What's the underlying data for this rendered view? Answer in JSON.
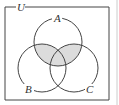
{
  "diagram": {
    "type": "venn",
    "universe_label": "U",
    "sets": [
      {
        "label": "A",
        "cx": 58,
        "cy": 42,
        "r": 24
      },
      {
        "label": "B",
        "cx": 42,
        "cy": 68,
        "r": 24
      },
      {
        "label": "C",
        "cx": 74,
        "cy": 68,
        "r": 24
      }
    ],
    "shaded_region": "A ∩ (B ∪ C)",
    "colors": {
      "stroke": "#444444",
      "shade": "#dcdcdc"
    }
  }
}
